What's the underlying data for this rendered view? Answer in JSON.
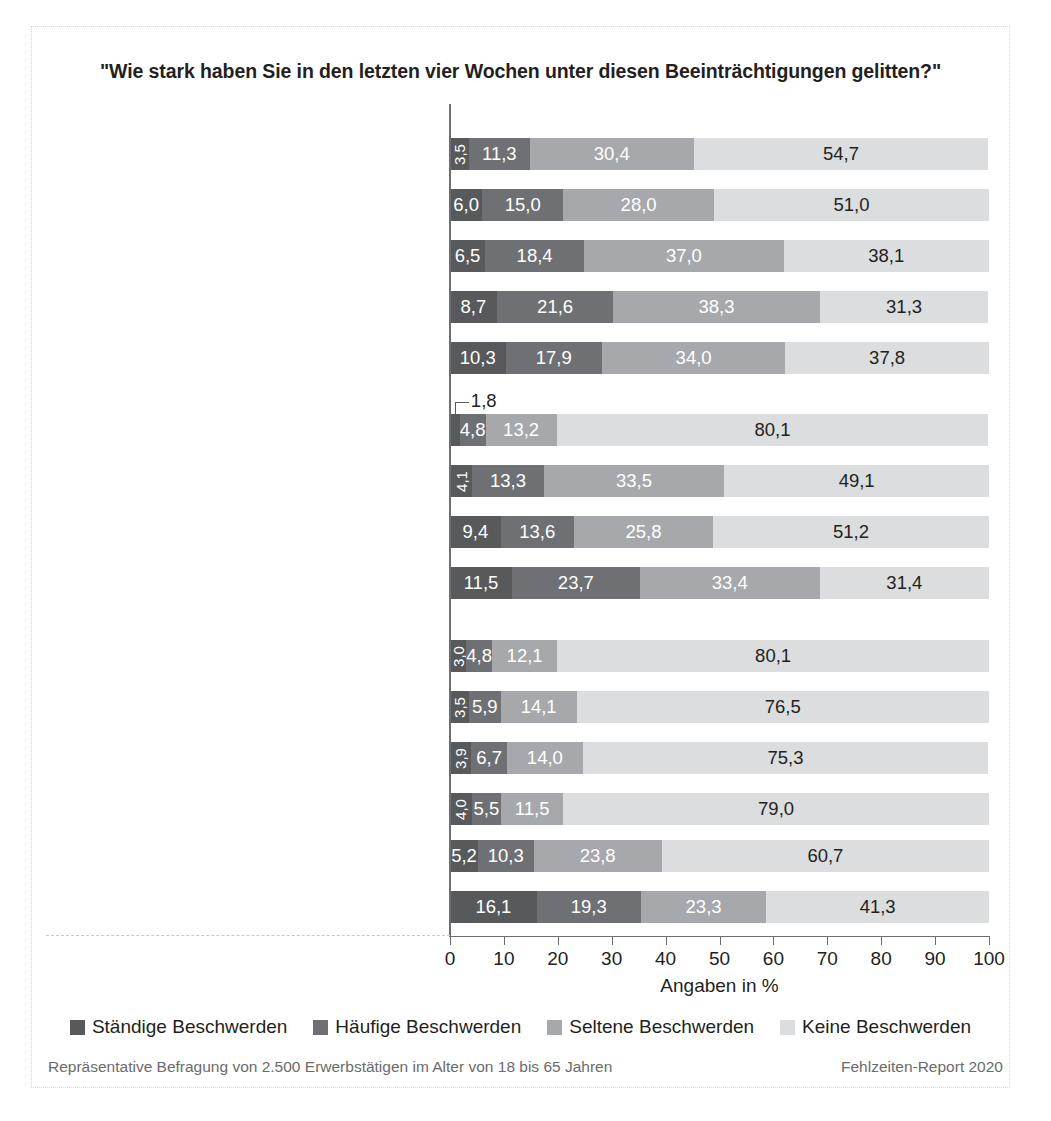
{
  "chart_data": {
    "type": "bar",
    "orientation": "horizontal",
    "stacked": true,
    "title": "\"Wie stark haben Sie in den letzten vier Wochen unter diesen Beeinträchtigungen gelitten?\"",
    "xlabel": "Angaben in %",
    "ylabel": "",
    "xlim": [
      0,
      100
    ],
    "xticks": [
      0,
      10,
      20,
      30,
      40,
      50,
      60,
      70,
      80,
      90,
      100
    ],
    "xtick_labels": [
      "0",
      "10",
      "20",
      "30",
      "40",
      "50",
      "60",
      "70",
      "80",
      "90",
      "100"
    ],
    "grid": false,
    "legend_position": "bottom",
    "series": [
      {
        "name": "Ständige Beschwerden",
        "color": "#58595b"
      },
      {
        "name": "Häufige Beschwerden",
        "color": "#6f7073"
      },
      {
        "name": "Seltene Beschwerden",
        "color": "#a6a8ab"
      },
      {
        "name": "Keine Beschwerden",
        "color": "#dcdddf"
      }
    ],
    "groups": [
      {
        "header": "Emotionale Irritationen",
        "rows": [
          {
            "category": "Zweifel an den eigenen Fähigkeiten",
            "values": [
              3.5,
              11.3,
              30.4,
              54.7
            ],
            "labels": [
              "3,5",
              "11,3",
              "30,4",
              "54,7"
            ],
            "rotated": [
              true,
              false,
              false,
              false
            ]
          },
          {
            "category": "Niedergeschlagenheit",
            "values": [
              6.0,
              15.0,
              28.0,
              51.0
            ],
            "labels": [
              "6,0",
              "15,0",
              "28,0",
              "51,0"
            ],
            "rotated": [
              false,
              false,
              false,
              false
            ]
          },
          {
            "category": "Nervosität und Reizbarkeit",
            "values": [
              6.5,
              18.4,
              37.0,
              38.1
            ],
            "labels": [
              "6,5",
              "18,4",
              "37,0",
              "38,1"
            ],
            "rotated": [
              false,
              false,
              false,
              false
            ]
          },
          {
            "category": "Wut und Verärgerung",
            "values": [
              8.7,
              21.6,
              38.3,
              31.3
            ],
            "labels": [
              "8,7",
              "21,6",
              "38,3",
              "31,3"
            ],
            "rotated": [
              false,
              false,
              false,
              false
            ]
          },
          {
            "category": "Lustlosigkeit, wie \"ausgebrannt\" fühlen",
            "values": [
              10.3,
              17.9,
              34.0,
              37.8
            ],
            "labels": [
              "10,3",
              "17,9",
              "34,0",
              "37,8"
            ],
            "rotated": [
              false,
              false,
              false,
              false
            ]
          }
        ]
      },
      {
        "header": "Psychosomatische Beschwerden",
        "rows": [
          {
            "category": "Angstgefühl bei und vor der Arbeit",
            "values": [
              1.8,
              4.8,
              13.2,
              80.1
            ],
            "labels": [
              "1,8",
              "4,8",
              "13,2",
              "80,1"
            ],
            "rotated": [
              false,
              false,
              false,
              false
            ],
            "callout": "1,8"
          },
          {
            "category": "Konzentrationsprobleme",
            "values": [
              4.1,
              13.3,
              33.5,
              49.1
            ],
            "labels": [
              "4,1",
              "13,3",
              "33,5",
              "49,1"
            ],
            "rotated": [
              true,
              false,
              false,
              false
            ]
          },
          {
            "category": "Schlafstörungen",
            "values": [
              9.4,
              13.6,
              25.8,
              51.2
            ],
            "labels": [
              "9,4",
              "13,6",
              "25,8",
              "51,2"
            ],
            "rotated": [
              false,
              false,
              false,
              false
            ]
          },
          {
            "category": "Erschöpfung",
            "values": [
              11.5,
              23.7,
              33.4,
              31.4
            ],
            "labels": [
              "11,5",
              "23,7",
              "33,4",
              "31,4"
            ],
            "rotated": [
              false,
              false,
              false,
              false
            ]
          }
        ]
      },
      {
        "header": "Körperliche Beschwerden",
        "rows": [
          {
            "category": "Herz-Kreislauf-Beschwerden",
            "values": [
              3.0,
              4.8,
              12.1,
              80.1
            ],
            "labels": [
              "3,0",
              "4,8",
              "12,1",
              "80,1"
            ],
            "rotated": [
              true,
              false,
              false,
              false
            ]
          },
          {
            "category": "Magen-Darm-Beschwerden",
            "values": [
              3.5,
              5.9,
              14.1,
              76.5
            ],
            "labels": [
              "3,5",
              "5,9",
              "14,1",
              "76,5"
            ],
            "rotated": [
              true,
              false,
              false,
              false
            ]
          },
          {
            "category": "Infektionserkrankungen",
            "values": [
              3.9,
              6.7,
              14.0,
              75.3
            ],
            "labels": [
              "3,9",
              "6,7",
              "14,0",
              "75,3"
            ],
            "rotated": [
              true,
              false,
              false,
              false
            ]
          },
          {
            "category": "Atmenwegserkrankungen",
            "values": [
              4.0,
              5.5,
              11.5,
              79.0
            ],
            "labels": [
              "4,0",
              "5,5",
              "11,5",
              "79,0"
            ],
            "rotated": [
              true,
              false,
              false,
              false
            ]
          },
          {
            "category": "Kopfschmerzen",
            "values": [
              5.2,
              10.3,
              23.8,
              60.7
            ],
            "labels": [
              "5,2",
              "10,3",
              "23,8",
              "60,7"
            ],
            "rotated": [
              false,
              false,
              false,
              false
            ]
          },
          {
            "category": "Rücken- und Gelenkbeschwerden",
            "values": [
              16.1,
              19.3,
              23.3,
              41.3
            ],
            "labels": [
              "16,1",
              "19,3",
              "23,3",
              "41,3"
            ],
            "rotated": [
              false,
              false,
              false,
              false
            ]
          }
        ]
      }
    ]
  },
  "footer": {
    "left": "Repräsentative Befragung von  2.500 Erwerbstätigen im Alter von 18 bis 65 Jahren",
    "right": "Fehlzeiten-Report 2020"
  }
}
